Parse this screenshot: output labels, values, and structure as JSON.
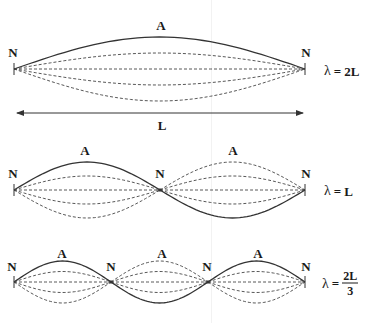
{
  "colors": {
    "line": "#333333",
    "dash": "#444444",
    "text": "#1a1a1a",
    "background": "#ffffff"
  },
  "diagrams": [
    {
      "id": "fundamental",
      "center_y": 69,
      "nodes_x": [
        14,
        305
      ],
      "node_labels": [
        "N",
        "N"
      ],
      "node_label_y": 52,
      "antinode_labels": [
        "A"
      ],
      "antinode_label_y": 25,
      "amplitude": 32,
      "solid_sign": [
        1
      ],
      "wavelength": {
        "symbol": "λ",
        "equals": "=",
        "value": "2L",
        "fraction": false,
        "x": 324,
        "y": 71
      }
    },
    {
      "id": "second-harmonic",
      "center_y": 190,
      "nodes_x": [
        14,
        160,
        305
      ],
      "node_labels": [
        "N",
        "N",
        "N"
      ],
      "node_label_y": 173,
      "antinode_labels": [
        "A",
        "A"
      ],
      "antinode_label_y": 150,
      "amplitude": 28,
      "solid_sign": [
        1,
        -1
      ],
      "wavelength": {
        "symbol": "λ",
        "equals": "=",
        "value": "L",
        "fraction": false,
        "x": 324,
        "y": 191
      }
    },
    {
      "id": "third-harmonic",
      "center_y": 282,
      "nodes_x": [
        14,
        111,
        208,
        305
      ],
      "node_labels": [
        "N",
        "N",
        "N",
        "N"
      ],
      "node_label_y": 266,
      "antinode_labels": [
        "A",
        "A",
        "A"
      ],
      "antinode_label_y": 253,
      "amplitude": 21,
      "solid_sign": [
        1,
        -1,
        1
      ],
      "wavelength": {
        "symbol": "λ",
        "equals": "=",
        "numerator": "2L",
        "denominator": "3",
        "fraction": true,
        "x": 322,
        "y": 283
      }
    }
  ],
  "length_arrow": {
    "x1": 17,
    "x2": 303,
    "y": 113,
    "label": "L",
    "label_y": 125
  },
  "labels": {
    "d0_n0": "N",
    "d0_n1": "N",
    "d0_a0": "A",
    "d1_n0": "N",
    "d1_n1": "N",
    "d1_n2": "N",
    "d1_a0": "A",
    "d1_a1": "A",
    "d2_n0": "N",
    "d2_n1": "N",
    "d2_n2": "N",
    "d2_n3": "N",
    "d2_a0": "A",
    "d2_a1": "A",
    "d2_a2": "A",
    "arrow_L": "L",
    "lambda_symbol": "λ",
    "equals": "=",
    "lam0_value": "2L",
    "lam1_value": "L",
    "lam2_num": "2L",
    "lam2_den": "3"
  }
}
